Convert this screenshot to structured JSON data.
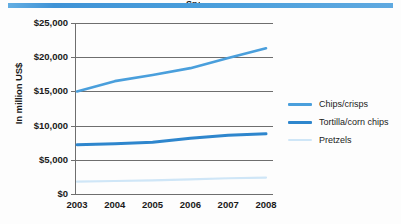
{
  "header": {
    "accent_color": "#4a9fdc",
    "clipped_title": "Snack"
  },
  "axis": {
    "y_title": "In million US$",
    "y_ticks": [
      "$25,000",
      "$20,000",
      "$15,000",
      "$10,000",
      "$5,000",
      "$0"
    ],
    "x_ticks": [
      "2003",
      "2004",
      "2005",
      "2006",
      "2007",
      "2008"
    ]
  },
  "legend": {
    "items": [
      {
        "label": "Chips/crisps",
        "color": "#4a9fdc"
      },
      {
        "label": "Tortilla/corn chips",
        "color": "#2e86cd"
      },
      {
        "label": "Pretzels",
        "color": "#cfe6f7"
      }
    ]
  },
  "chart_data": {
    "type": "line",
    "title": "",
    "xlabel": "",
    "ylabel": "In million US$",
    "x": [
      2003,
      2004,
      2005,
      2006,
      2007,
      2008
    ],
    "categories": [
      "2003",
      "2004",
      "2005",
      "2006",
      "2007",
      "2008"
    ],
    "ylim": [
      0,
      25000
    ],
    "ytick_values": [
      0,
      5000,
      10000,
      15000,
      20000,
      25000
    ],
    "grid": "horizontal",
    "legend_position": "right",
    "series": [
      {
        "name": "Chips/crisps",
        "color": "#4a9fdc",
        "values": [
          15000,
          16500,
          17400,
          18400,
          19900,
          21300
        ]
      },
      {
        "name": "Tortilla/corn chips",
        "color": "#2e86cd",
        "values": [
          7200,
          7350,
          7550,
          8150,
          8600,
          8800
        ]
      },
      {
        "name": "Pretzels",
        "color": "#cfe6f7",
        "values": [
          1800,
          1900,
          2000,
          2150,
          2300,
          2400
        ]
      }
    ]
  }
}
